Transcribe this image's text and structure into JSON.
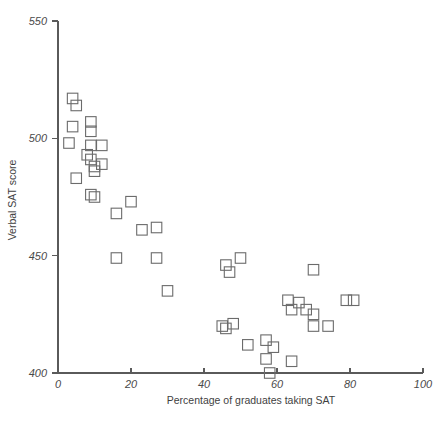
{
  "chart_data": {
    "type": "scatter",
    "title": "",
    "xlabel": "Percentage of graduates taking SAT",
    "ylabel": "Verbal SAT score",
    "xlim": [
      0,
      100
    ],
    "ylim": [
      400,
      550
    ],
    "xticks": [
      0,
      20,
      40,
      60,
      80,
      100
    ],
    "yticks": [
      400,
      450,
      500,
      550
    ],
    "xtick_labels": [
      "0",
      "20",
      "40",
      "60",
      "80",
      "100"
    ],
    "ytick_labels": [
      "400",
      "450",
      "500",
      "550"
    ],
    "grid": false,
    "legend": null,
    "marker": "open-square",
    "marker_color": "#6b6b6b",
    "points": [
      {
        "x": 4,
        "y": 517
      },
      {
        "x": 5,
        "y": 514
      },
      {
        "x": 4,
        "y": 505
      },
      {
        "x": 9,
        "y": 507
      },
      {
        "x": 9,
        "y": 503
      },
      {
        "x": 3,
        "y": 498
      },
      {
        "x": 9,
        "y": 497
      },
      {
        "x": 12,
        "y": 497
      },
      {
        "x": 8,
        "y": 493
      },
      {
        "x": 9,
        "y": 491
      },
      {
        "x": 12,
        "y": 489
      },
      {
        "x": 10,
        "y": 488
      },
      {
        "x": 10,
        "y": 486
      },
      {
        "x": 5,
        "y": 483
      },
      {
        "x": 9,
        "y": 476
      },
      {
        "x": 10,
        "y": 475
      },
      {
        "x": 20,
        "y": 473
      },
      {
        "x": 16,
        "y": 468
      },
      {
        "x": 23,
        "y": 461
      },
      {
        "x": 27,
        "y": 462
      },
      {
        "x": 16,
        "y": 449
      },
      {
        "x": 27,
        "y": 449
      },
      {
        "x": 30,
        "y": 435
      },
      {
        "x": 46,
        "y": 446
      },
      {
        "x": 47,
        "y": 443
      },
      {
        "x": 50,
        "y": 449
      },
      {
        "x": 70,
        "y": 444
      },
      {
        "x": 63,
        "y": 431
      },
      {
        "x": 66,
        "y": 430
      },
      {
        "x": 79,
        "y": 431
      },
      {
        "x": 81,
        "y": 431
      },
      {
        "x": 64,
        "y": 427
      },
      {
        "x": 68,
        "y": 427
      },
      {
        "x": 70,
        "y": 425
      },
      {
        "x": 45,
        "y": 420
      },
      {
        "x": 46,
        "y": 419
      },
      {
        "x": 48,
        "y": 421
      },
      {
        "x": 70,
        "y": 420
      },
      {
        "x": 74,
        "y": 420
      },
      {
        "x": 52,
        "y": 412
      },
      {
        "x": 57,
        "y": 414
      },
      {
        "x": 59,
        "y": 411
      },
      {
        "x": 57,
        "y": 406
      },
      {
        "x": 64,
        "y": 405
      },
      {
        "x": 58,
        "y": 400
      }
    ]
  }
}
